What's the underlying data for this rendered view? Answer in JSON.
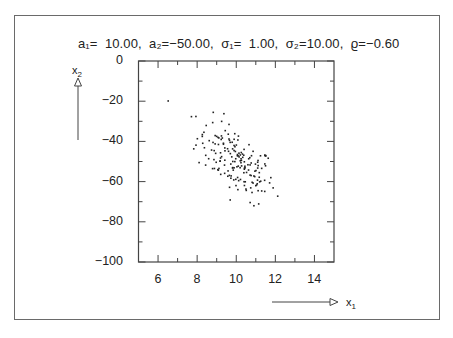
{
  "chart_data": {
    "type": "scatter",
    "title": "a₁=  10.00,  a₂=−50.00,  σ₁=  1.00,  σ₂=10.00,  ϱ=−0.60",
    "parameters": {
      "a1": 10.0,
      "a2": -50.0,
      "sigma1": 1.0,
      "sigma2": 10.0,
      "rho": -0.6
    },
    "xlabel": "x₁",
    "ylabel": "x₂",
    "xlim": [
      5,
      15
    ],
    "ylim": [
      -100,
      0
    ],
    "x_ticks": [
      6,
      8,
      10,
      12,
      14
    ],
    "x_minor_ticks": [
      7,
      9,
      11,
      13
    ],
    "y_ticks": [
      0,
      -20,
      -40,
      -60,
      -80,
      -100
    ],
    "y_minor_ticks": [
      -10,
      -30,
      -50,
      -70,
      -90
    ],
    "grid": false,
    "legend": null,
    "points_note": "Synthetic reconstruction: points are NOT read off the image. They are generated deterministically (seeded bivariate normal) from the printed parameters to approximate the visible cloud; individual positions will not match the screenshot.",
    "approx_point_count": 180,
    "points_are_synthetic": true,
    "marker_color": "#222222"
  },
  "labels": {
    "title": "a₁=  10.00,  a₂=−50.00,  σ₁=  1.00,  σ₂=10.00,  ϱ=−0.60",
    "x_axis_name": "x",
    "x_axis_sub": "1",
    "y_axis_name": "x",
    "y_axis_sub": "2"
  }
}
